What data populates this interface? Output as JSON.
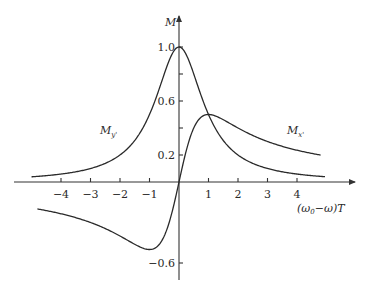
{
  "chart_data": {
    "type": "line",
    "title": "",
    "xlabel": "(ω0−ω)T",
    "ylabel": "M",
    "xlim": [
      -5,
      5
    ],
    "ylim": [
      -0.65,
      1.1
    ],
    "grid": false,
    "legend": "inline labels",
    "x_ticks": [
      -4,
      -3,
      -2,
      -1,
      1,
      2,
      3,
      4
    ],
    "x_tick_labels": [
      "−4",
      "−3",
      "−2",
      "−1",
      "1",
      "2",
      "3",
      "4"
    ],
    "y_ticks": [
      1.0,
      0.8,
      0.6,
      0.4,
      0.2,
      -0.6
    ],
    "y_tick_labels": [
      "1.0",
      "",
      "0.6",
      "",
      "0.2",
      "−0.6"
    ],
    "series": [
      {
        "name": "My'",
        "label_position": [
          -3.0,
          0.42
        ],
        "formula": "1/(1+x^2)",
        "x": [
          -5,
          -4,
          -3,
          -2,
          -1,
          -0.5,
          0,
          0.5,
          1,
          2,
          3,
          4,
          5
        ],
        "values": [
          0.038,
          0.059,
          0.1,
          0.2,
          0.5,
          0.8,
          1.0,
          0.8,
          0.5,
          0.2,
          0.1,
          0.059,
          0.038
        ]
      },
      {
        "name": "Mx'",
        "label_position": [
          3.6,
          0.42
        ],
        "formula": "x/(1+x^2)",
        "x": [
          -5,
          -4,
          -3,
          -2,
          -1,
          -0.5,
          0,
          0.5,
          1,
          2,
          3,
          4,
          5
        ],
        "values": [
          -0.19,
          -0.235,
          -0.3,
          -0.4,
          -0.5,
          -0.4,
          0.0,
          0.4,
          0.5,
          0.4,
          0.3,
          0.235,
          0.19
        ]
      }
    ]
  },
  "labels": {
    "y_axis": "M",
    "x_axis": "(ω0−ω)T",
    "series_my": "My'",
    "series_mx": "Mx'"
  }
}
